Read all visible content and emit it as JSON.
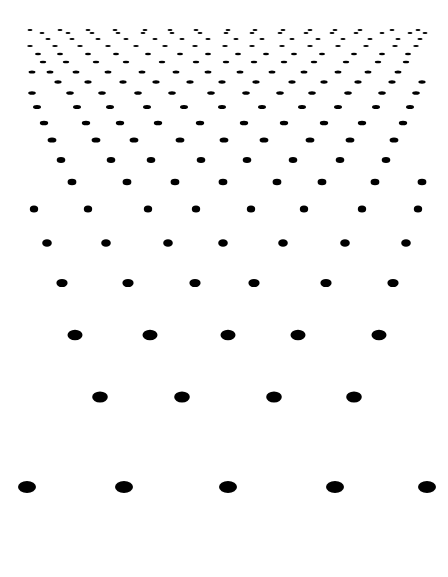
{
  "canvas": {
    "width": 448,
    "height": 577,
    "background": "#ffffff",
    "dot_color": "#000000"
  },
  "rows": [
    {
      "y": 30,
      "rx": 2.5,
      "ry": 0.9,
      "xs": [
        30,
        60,
        88,
        115,
        145,
        170,
        196,
        228,
        255,
        283,
        310,
        335,
        360,
        392,
        418
      ]
    },
    {
      "y": 33,
      "rx": 2.5,
      "ry": 0.9,
      "xs": [
        42,
        68,
        92,
        118,
        143,
        172,
        200,
        226,
        252,
        280,
        306,
        332,
        356,
        382,
        410,
        425
      ]
    },
    {
      "y": 39,
      "rx": 2.6,
      "ry": 1.0,
      "xs": [
        48,
        72,
        98,
        126,
        155,
        182,
        208,
        236,
        262,
        292,
        318,
        343,
        370,
        398,
        420
      ]
    },
    {
      "y": 46,
      "rx": 2.8,
      "ry": 1.1,
      "xs": [
        30,
        55,
        80,
        108,
        136,
        165,
        195,
        225,
        252,
        282,
        310,
        338,
        366,
        395,
        416
      ]
    },
    {
      "y": 54,
      "rx": 3.0,
      "ry": 1.2,
      "xs": [
        38,
        60,
        88,
        116,
        148,
        180,
        208,
        238,
        266,
        294,
        322,
        354,
        382,
        408
      ]
    },
    {
      "y": 62,
      "rx": 3.2,
      "ry": 1.3,
      "xs": [
        43,
        66,
        96,
        126,
        162,
        196,
        226,
        254,
        284,
        314,
        346,
        378,
        406
      ]
    },
    {
      "y": 72,
      "rx": 3.4,
      "ry": 1.5,
      "xs": [
        32,
        50,
        76,
        108,
        142,
        176,
        208,
        240,
        272,
        304,
        338,
        368,
        398
      ]
    },
    {
      "y": 82,
      "rx": 3.6,
      "ry": 1.7,
      "xs": [
        58,
        88,
        123,
        156,
        190,
        222,
        256,
        292,
        324,
        358,
        392,
        422
      ]
    },
    {
      "y": 93,
      "rx": 3.8,
      "ry": 1.8,
      "xs": [
        32,
        70,
        102,
        138,
        172,
        211,
        246,
        280,
        312,
        348,
        382,
        416
      ]
    },
    {
      "y": 107,
      "rx": 4.0,
      "ry": 2.0,
      "xs": [
        37,
        77,
        110,
        147,
        184,
        222,
        262,
        302,
        338,
        376,
        410
      ]
    },
    {
      "y": 123,
      "rx": 4.2,
      "ry": 2.3,
      "xs": [
        44,
        86,
        120,
        158,
        200,
        244,
        284,
        324,
        362,
        403
      ]
    },
    {
      "y": 140,
      "rx": 4.4,
      "ry": 2.6,
      "xs": [
        52,
        96,
        134,
        180,
        224,
        264,
        310,
        350,
        394
      ]
    },
    {
      "y": 160,
      "rx": 4.3,
      "ry": 3.0,
      "xs": [
        61,
        111,
        151,
        201,
        247,
        293,
        340,
        386
      ]
    },
    {
      "y": 182,
      "rx": 4.4,
      "ry": 3.3,
      "xs": [
        72,
        127,
        175,
        223,
        277,
        322,
        375,
        422
      ]
    },
    {
      "y": 209,
      "rx": 4.2,
      "ry": 3.5,
      "xs": [
        34,
        88,
        148,
        196,
        251,
        304,
        362,
        418
      ]
    },
    {
      "y": 243,
      "rx": 4.8,
      "ry": 3.8,
      "xs": [
        47,
        106,
        168,
        223,
        283,
        345,
        406
      ]
    },
    {
      "y": 283,
      "rx": 5.6,
      "ry": 4.1,
      "xs": [
        62,
        128,
        195,
        254,
        326,
        393
      ]
    },
    {
      "y": 335,
      "rx": 7.5,
      "ry": 5.2,
      "xs": [
        75,
        150,
        228,
        298,
        379
      ]
    },
    {
      "y": 397,
      "rx": 7.8,
      "ry": 5.6,
      "xs": [
        100,
        182,
        274,
        354
      ]
    },
    {
      "y": 487,
      "rx": 9.0,
      "ry": 6.0,
      "xs": [
        27,
        124,
        228,
        335,
        427
      ]
    }
  ]
}
